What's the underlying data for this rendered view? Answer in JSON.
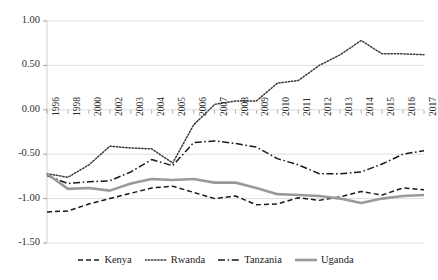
{
  "chart_data": {
    "type": "line",
    "title": "",
    "subtitle": "",
    "xlabel": "",
    "ylabel": "",
    "grid": true,
    "legend_position": "bottom",
    "xlim": [
      0,
      17
    ],
    "ylim": [
      -1.5,
      1.0
    ],
    "ytick_labels": [
      "1.00",
      "0.50",
      "0.00",
      "-0.50",
      "-1.00",
      "-1.50"
    ],
    "ytick_values": [
      1.0,
      0.5,
      0.0,
      -0.5,
      -1.0,
      -1.5
    ],
    "categories": [
      "1996",
      "1998",
      "2000",
      "2002",
      "2003",
      "2004",
      "2005",
      "2006",
      "2007",
      "2008",
      "2009",
      "2010",
      "2011",
      "2012",
      "2013",
      "2014",
      "2015",
      "2016",
      "2017"
    ],
    "x": [
      "1996",
      "1998",
      "2000",
      "2002",
      "2003",
      "2004",
      "2005",
      "2006",
      "2007",
      "2008",
      "2009",
      "2010",
      "2011",
      "2012",
      "2013",
      "2014",
      "2015",
      "2016",
      "2017"
    ],
    "series": [
      {
        "name": "Kenya",
        "style": "dashed",
        "color": "#1a1a1a",
        "values": [
          -1.15,
          -1.14,
          -1.06,
          -1.0,
          -0.94,
          -0.88,
          -0.86,
          -0.93,
          -1.0,
          -0.97,
          -1.07,
          -1.06,
          -0.99,
          -1.02,
          -0.98,
          -0.92,
          -0.96,
          -0.88,
          -0.9
        ]
      },
      {
        "name": "Rwanda",
        "style": "dotted",
        "color": "#3a3a3a",
        "values": [
          -0.72,
          -0.76,
          -0.62,
          -0.41,
          -0.43,
          -0.44,
          -0.6,
          -0.17,
          0.06,
          0.1,
          0.1,
          0.3,
          0.33,
          0.5,
          0.62,
          0.78,
          0.63,
          0.63,
          0.62
        ]
      },
      {
        "name": "Tanzania",
        "style": "dashdot",
        "color": "#1a1a1a",
        "values": [
          -0.74,
          -0.83,
          -0.81,
          -0.8,
          -0.7,
          -0.56,
          -0.63,
          -0.37,
          -0.35,
          -0.38,
          -0.42,
          -0.55,
          -0.62,
          -0.72,
          -0.72,
          -0.7,
          -0.61,
          -0.5,
          -0.46
        ]
      },
      {
        "name": "Uganda",
        "style": "solid",
        "color": "#9a9a9a",
        "values": [
          -0.72,
          -0.89,
          -0.88,
          -0.91,
          -0.83,
          -0.78,
          -0.79,
          -0.78,
          -0.82,
          -0.82,
          -0.88,
          -0.95,
          -0.96,
          -0.97,
          -1.0,
          -1.05,
          -1.0,
          -0.97,
          -0.96
        ]
      }
    ]
  },
  "legend": {
    "items": [
      {
        "label": "Kenya"
      },
      {
        "label": "Rwanda"
      },
      {
        "label": "Tanzania"
      },
      {
        "label": "Uganda"
      }
    ]
  }
}
